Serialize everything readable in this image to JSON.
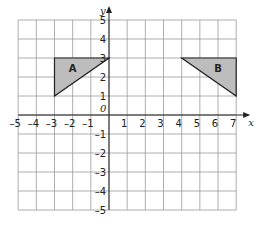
{
  "diagram": {
    "type": "coordinate-grid",
    "x_axis": {
      "label": "x",
      "min": -5,
      "max": 7,
      "ticks": [
        "-5",
        "-4",
        "-3",
        "-2",
        "-1",
        "1",
        "2",
        "3",
        "4",
        "5",
        "6",
        "7"
      ]
    },
    "y_axis": {
      "label": "y",
      "min": -5,
      "max": 5,
      "ticks": [
        "5",
        "4",
        "3",
        "2",
        "1",
        "-1",
        "-2",
        "-3",
        "-4",
        "-5"
      ]
    },
    "origin_label": "0",
    "shapes": [
      {
        "label": "A",
        "vertices": [
          [
            -3,
            3
          ],
          [
            0,
            3
          ],
          [
            -3,
            1
          ]
        ],
        "fill": "#bdbdbd",
        "stroke": "#222222",
        "label_pos": [
          -2,
          2.5
        ]
      },
      {
        "label": "B",
        "vertices": [
          [
            4,
            3
          ],
          [
            7,
            3
          ],
          [
            7,
            1
          ]
        ],
        "fill": "#bdbdbd",
        "stroke": "#222222",
        "label_pos": [
          6,
          2.5
        ]
      }
    ],
    "grid_color": "#9a9a9a",
    "axis_color": "#222222"
  }
}
